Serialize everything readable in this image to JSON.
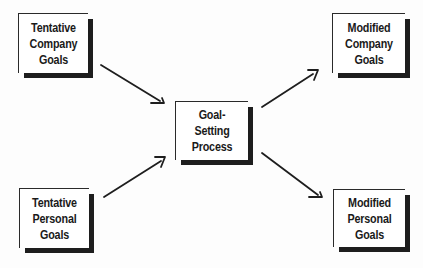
{
  "diagram": {
    "type": "flow",
    "nodes": [
      {
        "id": "tentative-company-goals",
        "lines": [
          "Tentative",
          "Company",
          "Goals"
        ]
      },
      {
        "id": "tentative-personal-goals",
        "lines": [
          "Tentative",
          "Personal",
          "Goals"
        ]
      },
      {
        "id": "goal-setting-process",
        "lines": [
          "Goal-",
          "Setting",
          "Process"
        ]
      },
      {
        "id": "modified-company-goals",
        "lines": [
          "Modified",
          "Company",
          "Goals"
        ]
      },
      {
        "id": "modified-personal-goals",
        "lines": [
          "Modified",
          "Personal",
          "Goals"
        ]
      }
    ],
    "edges": [
      {
        "from": "tentative-company-goals",
        "to": "goal-setting-process"
      },
      {
        "from": "tentative-personal-goals",
        "to": "goal-setting-process"
      },
      {
        "from": "goal-setting-process",
        "to": "modified-company-goals"
      },
      {
        "from": "goal-setting-process",
        "to": "modified-personal-goals"
      }
    ]
  },
  "colors": {
    "ink": "#1e1e1e",
    "background": "#ffffff"
  }
}
